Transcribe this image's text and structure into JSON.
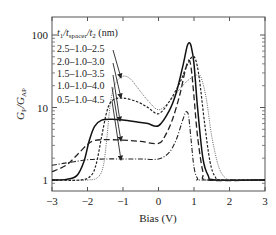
{
  "chart_data": {
    "type": "line",
    "title": "",
    "xlabel": "Bias (V)",
    "ylabel": "G_P/G_AP",
    "ylabel_main": "G",
    "ylabel_sub1": "P",
    "ylabel_slash": "/G",
    "ylabel_sub2": "AP",
    "xlim": [
      -3,
      3
    ],
    "ylim": [
      0.85,
      160
    ],
    "yscale": "log",
    "grid": false,
    "x_ticks": [
      -3,
      -2,
      -1,
      0,
      1,
      2,
      3
    ],
    "x_tick_labels": [
      "−3",
      "−2",
      "−1",
      "0",
      "1",
      "2",
      "3"
    ],
    "y_ticks": [
      1,
      10,
      100
    ],
    "y_tick_labels": [
      "1",
      "10",
      "100"
    ],
    "legend": {
      "title": "t1/tspacer/t2 (nm)",
      "title_parts": {
        "t1": "t",
        "s1": "1",
        "slash1": "/t",
        "s2": "spacer",
        "slash2": "/t",
        "s3": "2",
        "unit": " (nm)"
      },
      "position": "upper-left, with arrows pointing to curves",
      "entries": [
        "2.5–1.0–2.5",
        "2.0–1.0–3.0",
        "1.5–1.0–3.5",
        "1.0–1.0–4.0",
        "0.5–1.0–4.5"
      ]
    },
    "series": [
      {
        "name": "2.5–1.0–2.5",
        "style": "dotted-thin",
        "x": [
          -3,
          -2,
          -1.7,
          -1.55,
          -1.45,
          -1.35,
          -1.2,
          -1.0,
          -0.8,
          -0.6,
          -0.3,
          0.0,
          0.3,
          0.6,
          0.8,
          1.0,
          1.1,
          1.2,
          1.35,
          1.5,
          1.7,
          1.9,
          2.1,
          3
        ],
        "y": [
          1.0,
          1.0,
          1.1,
          1.6,
          4.0,
          12,
          22,
          27,
          25,
          19,
          12.5,
          9.3,
          12,
          18,
          23,
          27,
          28,
          26,
          13,
          4,
          1.5,
          1.05,
          1.0,
          1.0
        ]
      },
      {
        "name": "2.0–1.0–3.0",
        "style": "short-dash",
        "x": [
          -3,
          -2.2,
          -1.9,
          -1.75,
          -1.6,
          -1.45,
          -1.3,
          -1.0,
          -0.6,
          -0.3,
          0.0,
          0.3,
          0.6,
          0.8,
          0.95,
          1.05,
          1.15,
          1.3,
          1.45,
          1.6,
          1.8,
          3
        ],
        "y": [
          1.0,
          1.0,
          1.15,
          1.7,
          4.0,
          9.0,
          12.5,
          13.5,
          12,
          10,
          8.2,
          12,
          22,
          38,
          50,
          45,
          25,
          6,
          1.8,
          1.1,
          1.0,
          1.0
        ]
      },
      {
        "name": "1.5–1.0–3.5",
        "style": "solid",
        "x": [
          -3,
          -2.6,
          -2.3,
          -2.1,
          -1.95,
          -1.8,
          -1.6,
          -1.3,
          -1.0,
          -0.6,
          -0.3,
          0.0,
          0.3,
          0.5,
          0.7,
          0.8,
          0.86,
          0.92,
          1.0,
          1.1,
          1.25,
          1.4,
          1.6,
          3
        ],
        "y": [
          1.0,
          1.02,
          1.15,
          1.8,
          3.5,
          5.5,
          6.7,
          6.9,
          6.7,
          6.3,
          6.0,
          5.6,
          9,
          16,
          40,
          68,
          78,
          70,
          40,
          10,
          2.0,
          1.15,
          1.0,
          1.0
        ]
      },
      {
        "name": "1.0–1.0–4.0",
        "style": "long-dash",
        "x": [
          -3,
          -2.6,
          -2.3,
          -2.0,
          -1.8,
          -1.5,
          -1.0,
          -0.5,
          0.0,
          0.2,
          0.4,
          0.6,
          0.75,
          0.85,
          0.92,
          1.0,
          1.1,
          1.25,
          1.4,
          3
        ],
        "y": [
          1.3,
          1.6,
          2.2,
          3.1,
          3.5,
          3.6,
          3.55,
          3.4,
          3.2,
          4.2,
          7,
          15,
          32,
          45,
          35,
          14,
          4,
          1.3,
          1.0,
          1.0
        ]
      },
      {
        "name": "0.5–1.0–4.5",
        "style": "dash-dot",
        "x": [
          -3,
          -2.5,
          -2.0,
          -1.5,
          -1.0,
          -0.5,
          0.0,
          0.3,
          0.5,
          0.65,
          0.75,
          0.8,
          0.85,
          0.92,
          1.0,
          1.1,
          1.25,
          3
        ],
        "y": [
          1.6,
          1.75,
          1.9,
          1.95,
          1.95,
          1.95,
          1.95,
          2.4,
          3.6,
          6.0,
          8.3,
          8.7,
          7.5,
          3.5,
          1.5,
          1.05,
          1.0,
          1.0
        ]
      }
    ],
    "arrows": [
      {
        "from_entry": 0,
        "to_x": -1.0,
        "to_y": 27
      },
      {
        "from_entry": 1,
        "to_x": -1.0,
        "to_y": 13.5
      },
      {
        "from_entry": 2,
        "to_x": -1.0,
        "to_y": 6.7
      },
      {
        "from_entry": 3,
        "to_x": -1.0,
        "to_y": 3.55
      },
      {
        "from_entry": 4,
        "to_x": -1.0,
        "to_y": 1.95
      }
    ]
  }
}
